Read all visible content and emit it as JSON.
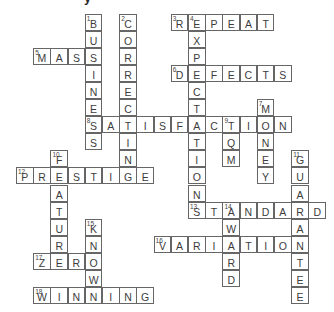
{
  "page": {
    "background": "#ffffff",
    "cropped_title_text": "y"
  },
  "grid": {
    "origin_x": 16,
    "origin_y": 14,
    "pitch_x": 17.2,
    "pitch_y": 17.05,
    "cell_w": 17.6,
    "cell_h": 17,
    "border_color": "#666666",
    "letter_color": "#3c3c3c",
    "number_color": "#444444",
    "cell_background": "#ffffff"
  },
  "puzzle": {
    "type": "crossword",
    "rows": 17,
    "cols": 18,
    "across": [
      {
        "number": 3,
        "answer": "REPEAT",
        "row": 0,
        "col": 9
      },
      {
        "number": 5,
        "answer": "MASS",
        "row": 2,
        "col": 1
      },
      {
        "number": 6,
        "answer": "DEFECTS",
        "row": 3,
        "col": 9
      },
      {
        "number": 8,
        "answer": "SATISFACTION",
        "row": 6,
        "col": 4
      },
      {
        "number": 12,
        "answer": "PRESTIGE",
        "row": 9,
        "col": 0
      },
      {
        "number": 13,
        "answer": "STANDARD",
        "row": 11,
        "col": 10
      },
      {
        "number": 16,
        "answer": "VARIATION",
        "row": 13,
        "col": 8
      },
      {
        "number": 17,
        "answer": "ZERO",
        "row": 14,
        "col": 1
      },
      {
        "number": 18,
        "answer": "WINNING",
        "row": 16,
        "col": 1
      }
    ],
    "down": [
      {
        "number": 1,
        "answer": "BUSINESS",
        "row": 0,
        "col": 4
      },
      {
        "number": 2,
        "answer": "CORRECTING",
        "row": 0,
        "col": 6
      },
      {
        "number": 4,
        "answer": "EXPECTATIONS",
        "row": 0,
        "col": 10
      },
      {
        "number": 7,
        "answer": "MONEY",
        "row": 5,
        "col": 14
      },
      {
        "number": 9,
        "answer": "TQM",
        "row": 6,
        "col": 12
      },
      {
        "number": 10,
        "answer": "FEATURE",
        "row": 8,
        "col": 2
      },
      {
        "number": 11,
        "answer": "GUARANTEE",
        "row": 8,
        "col": 16
      },
      {
        "number": 14,
        "answer": "AWARD",
        "row": 11,
        "col": 12
      },
      {
        "number": 15,
        "answer": "KNOWN",
        "row": 12,
        "col": 4
      }
    ]
  }
}
